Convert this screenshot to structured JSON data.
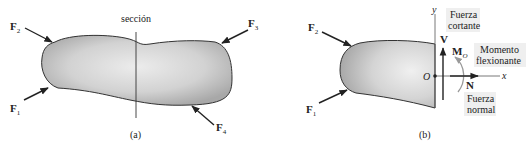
{
  "figure_a": {
    "caption": "(a)",
    "section_label": "sección",
    "forces": [
      {
        "name": "F",
        "sub": "1"
      },
      {
        "name": "F",
        "sub": "2"
      },
      {
        "name": "F",
        "sub": "3"
      },
      {
        "name": "F",
        "sub": "4"
      }
    ]
  },
  "figure_b": {
    "caption": "(b)",
    "forces": [
      {
        "name": "F",
        "sub": "1"
      },
      {
        "name": "F",
        "sub": "2"
      }
    ],
    "axis_y": "y",
    "axis_x": "x",
    "origin": "O",
    "shear": {
      "symbol": "V",
      "label_line1": "Fuerza",
      "label_line2": "cortante"
    },
    "moment": {
      "symbol": "M",
      "sub": "O",
      "label_line1": "Momento",
      "label_line2": "flexionante"
    },
    "normal": {
      "symbol": "N",
      "label_line1": "Fuerza",
      "label_line2": "normal"
    }
  },
  "colors": {
    "body_edge": "#9a9a9a",
    "body_center": "#e6e6e6",
    "outline": "#333333",
    "label_bg": "#efefef",
    "moment_arrow": "#999999"
  }
}
